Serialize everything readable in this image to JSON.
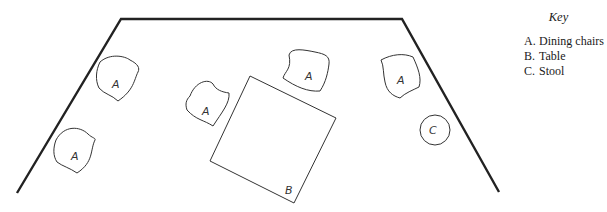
{
  "key": {
    "title": "Key",
    "items": [
      {
        "letter": "A.",
        "label": "Dining chairs"
      },
      {
        "letter": "B.",
        "label": "Table"
      },
      {
        "letter": "C.",
        "label": "Stool"
      }
    ]
  },
  "diagram": {
    "room_outline": "trapezoid",
    "labels": {
      "chair": "A",
      "table": "B",
      "stool": "C"
    },
    "chair_count": 6,
    "table_count": 1,
    "stool_count": 1
  }
}
